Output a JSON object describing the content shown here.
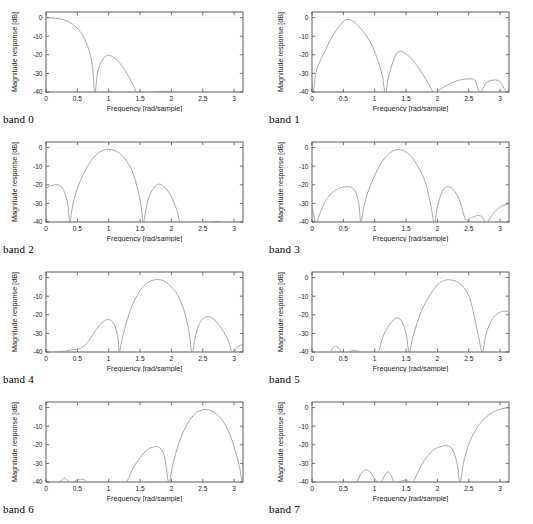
{
  "figure": {
    "title": "",
    "panel_count": 8,
    "grid": {
      "rows": 4,
      "cols": 2
    }
  },
  "axes": {
    "xlabel": "Frequency [rad/sample]",
    "ylabel": "Magnitude response [dB]",
    "xticks": [
      "0",
      "0.5",
      "1",
      "1.5",
      "2",
      "2.5",
      "3"
    ],
    "xtick_values": [
      0,
      0.5,
      1,
      1.5,
      2,
      2.5,
      3
    ],
    "yticks": [
      "0",
      "-10",
      "-20",
      "-30",
      "-40"
    ],
    "ytick_values": [
      0,
      -10,
      -20,
      -30,
      -40
    ],
    "xlim": [
      0,
      3.14159
    ],
    "ylim": [
      -40,
      3
    ],
    "grid": false,
    "box": true,
    "tick_direction": "in"
  },
  "colors": {
    "curve": "#8a8a8a",
    "axis": "#4d4d4d",
    "text": "#1a1a1a",
    "background": "#ffffff"
  },
  "captions": [
    "band 0",
    "band 1",
    "band 2",
    "band 3",
    "band 4",
    "band 5",
    "band 6",
    "band 7"
  ],
  "chart_data": [
    {
      "type": "line",
      "title": "band 0",
      "xlabel": "Frequency [rad/sample]",
      "ylabel": "Magnitude response [dB]",
      "xlim": [
        0,
        3.14159
      ],
      "ylim": [
        -40,
        3
      ],
      "grid": false,
      "legend": "none",
      "passband_center": 0.0,
      "nulls": [
        0.78,
        1.45
      ],
      "sidelobe_peaks": [
        {
          "x": 0.98,
          "y": -20
        },
        {
          "x": 1.9,
          "y": -39.5
        }
      ],
      "x": [
        0,
        0.1,
        0.2,
        0.3,
        0.4,
        0.5,
        0.6,
        0.68,
        0.74,
        0.78,
        0.82,
        0.88,
        0.98,
        1.1,
        1.2,
        1.3,
        1.4,
        1.45,
        1.55,
        1.7,
        1.9,
        2.1,
        2.4,
        2.7,
        3.0,
        3.14159
      ],
      "y": [
        -0.2,
        -0.3,
        -0.6,
        -1.4,
        -3.0,
        -5.8,
        -10.5,
        -17.0,
        -26.0,
        -41.0,
        -30.0,
        -24.0,
        -20.2,
        -22.0,
        -25.5,
        -30.5,
        -37.0,
        -40.5,
        -40.3,
        -40.2,
        -39.6,
        -40.2,
        -40.4,
        -40.3,
        -40.3,
        -40.3
      ]
    },
    {
      "type": "line",
      "title": "band 1",
      "xlabel": "Frequency [rad/sample]",
      "ylabel": "Magnitude response [dB]",
      "xlim": [
        0,
        3.14159
      ],
      "ylim": [
        -40,
        3
      ],
      "grid": false,
      "legend": "none",
      "passband_center": 0.56,
      "nulls": [
        0.02,
        1.17,
        1.95,
        2.68,
        3.1
      ],
      "sidelobe_peaks": [
        {
          "x": 1.38,
          "y": -18.2
        },
        {
          "x": 2.52,
          "y": -33.0
        },
        {
          "x": 2.9,
          "y": -33.5
        }
      ],
      "x": [
        0,
        0.02,
        0.06,
        0.12,
        0.2,
        0.3,
        0.4,
        0.5,
        0.56,
        0.64,
        0.74,
        0.85,
        0.95,
        1.05,
        1.12,
        1.17,
        1.22,
        1.3,
        1.38,
        1.5,
        1.62,
        1.75,
        1.88,
        1.95,
        2.05,
        2.2,
        2.35,
        2.45,
        2.52,
        2.6,
        2.68,
        2.78,
        2.9,
        3.0,
        3.1,
        3.14159
      ],
      "y": [
        -34.0,
        -40.5,
        -30.0,
        -24.0,
        -18.5,
        -11.5,
        -6.2,
        -2.2,
        -1.0,
        -1.6,
        -4.5,
        -9.0,
        -14.5,
        -23.0,
        -31.0,
        -41.0,
        -32.0,
        -23.0,
        -18.3,
        -19.6,
        -23.5,
        -29.5,
        -37.0,
        -40.5,
        -38.5,
        -35.5,
        -33.6,
        -33.1,
        -33.0,
        -33.8,
        -40.0,
        -35.0,
        -33.6,
        -34.5,
        -40.0,
        -38.0
      ]
    },
    {
      "type": "line",
      "title": "band 2",
      "xlabel": "Frequency [rad/sample]",
      "ylabel": "Magnitude response [dB]",
      "xlim": [
        0,
        3.14159
      ],
      "ylim": [
        -40,
        3
      ],
      "grid": false,
      "legend": "none",
      "passband_center": 1.0,
      "nulls": [
        0.38,
        1.55,
        2.15,
        2.62,
        2.85
      ],
      "sidelobe_peaks": [
        {
          "x": 0.18,
          "y": -20.0
        },
        {
          "x": 1.78,
          "y": -19.8
        },
        {
          "x": 2.72,
          "y": -39.6
        }
      ],
      "x": [
        0,
        0.06,
        0.12,
        0.18,
        0.25,
        0.31,
        0.35,
        0.38,
        0.42,
        0.48,
        0.58,
        0.7,
        0.82,
        0.92,
        1.0,
        1.1,
        1.2,
        1.3,
        1.38,
        1.46,
        1.52,
        1.55,
        1.6,
        1.66,
        1.78,
        1.9,
        2.0,
        2.08,
        2.15,
        2.3,
        2.5,
        2.62,
        2.72,
        2.85,
        3.0,
        3.14159
      ],
      "y": [
        -22.0,
        -20.8,
        -20.2,
        -20.0,
        -21.2,
        -25.5,
        -31.0,
        -41.0,
        -32.0,
        -24.0,
        -15.5,
        -8.0,
        -3.2,
        -1.4,
        -1.0,
        -1.6,
        -3.8,
        -8.0,
        -13.0,
        -22.0,
        -32.0,
        -41.0,
        -32.0,
        -25.0,
        -19.8,
        -21.5,
        -26.5,
        -33.0,
        -41.0,
        -40.3,
        -40.2,
        -40.4,
        -39.6,
        -40.4,
        -40.3,
        -40.3
      ]
    },
    {
      "type": "line",
      "title": "band 3",
      "xlabel": "Frequency [rad/sample]",
      "ylabel": "Magnitude response [dB]",
      "xlim": [
        0,
        3.14159
      ],
      "ylim": [
        -40,
        3
      ],
      "grid": false,
      "legend": "none",
      "passband_center": 1.35,
      "nulls": [
        0.07,
        0.78,
        1.95,
        2.45,
        2.78
      ],
      "sidelobe_peaks": [
        {
          "x": 0.58,
          "y": -21.0
        },
        {
          "x": 2.15,
          "y": -21.0
        },
        {
          "x": 2.65,
          "y": -36.5
        }
      ],
      "x": [
        0,
        0.04,
        0.07,
        0.12,
        0.2,
        0.3,
        0.42,
        0.52,
        0.58,
        0.64,
        0.7,
        0.75,
        0.78,
        0.82,
        0.88,
        0.98,
        1.1,
        1.22,
        1.35,
        1.48,
        1.6,
        1.72,
        1.82,
        1.9,
        1.95,
        2.0,
        2.07,
        2.15,
        2.25,
        2.35,
        2.45,
        2.55,
        2.65,
        2.72,
        2.78,
        2.9,
        3.02,
        3.14159
      ],
      "y": [
        -32.0,
        -38.0,
        -41.0,
        -36.0,
        -29.5,
        -25.0,
        -22.0,
        -21.2,
        -21.0,
        -21.6,
        -24.0,
        -31.0,
        -41.0,
        -33.0,
        -25.0,
        -16.5,
        -8.5,
        -3.5,
        -1.1,
        -2.0,
        -5.5,
        -12.0,
        -20.0,
        -32.0,
        -41.0,
        -32.0,
        -24.0,
        -21.0,
        -22.5,
        -28.0,
        -38.5,
        -37.5,
        -36.5,
        -37.5,
        -41.0,
        -35.0,
        -31.5,
        -30.5
      ]
    },
    {
      "type": "line",
      "title": "band 4",
      "xlabel": "Frequency [rad/sample]",
      "ylabel": "Magnitude response [dB]",
      "xlim": [
        0,
        3.14159
      ],
      "ylim": [
        -40,
        3
      ],
      "grid": false,
      "legend": "none",
      "passband_center": 1.78,
      "nulls": [
        0.04,
        1.17,
        2.33,
        2.98
      ],
      "sidelobe_peaks": [
        {
          "x": 0.98,
          "y": -22.5
        },
        {
          "x": 2.56,
          "y": -21.0
        },
        {
          "x": 0.5,
          "y": -38.5
        }
      ],
      "x": [
        0,
        0.04,
        0.12,
        0.3,
        0.42,
        0.5,
        0.58,
        0.68,
        0.78,
        0.88,
        0.98,
        1.05,
        1.1,
        1.15,
        1.17,
        1.2,
        1.26,
        1.35,
        1.48,
        1.6,
        1.7,
        1.78,
        1.88,
        2.0,
        2.1,
        2.2,
        2.28,
        2.33,
        2.38,
        2.45,
        2.56,
        2.68,
        2.8,
        2.9,
        2.98,
        3.06,
        3.14159
      ],
      "y": [
        -39.0,
        -41.0,
        -40.2,
        -39.5,
        -38.8,
        -38.5,
        -37.5,
        -34.0,
        -29.0,
        -24.5,
        -22.5,
        -23.5,
        -26.0,
        -33.0,
        -41.0,
        -35.0,
        -27.0,
        -17.0,
        -8.0,
        -3.2,
        -1.5,
        -1.1,
        -1.8,
        -5.0,
        -9.5,
        -17.5,
        -29.0,
        -41.0,
        -32.0,
        -24.5,
        -21.0,
        -22.5,
        -27.5,
        -33.5,
        -41.0,
        -37.0,
        -36.0
      ]
    },
    {
      "type": "line",
      "title": "band 5",
      "xlabel": "Frequency [rad/sample]",
      "ylabel": "Magnitude response [dB]",
      "xlim": [
        0,
        3.14159
      ],
      "ylim": [
        -40,
        3
      ],
      "grid": false,
      "legend": "none",
      "passband_center": 2.15,
      "nulls": [
        0.28,
        0.48,
        0.58,
        0.78,
        1.05,
        1.55,
        2.72
      ],
      "sidelobe_peaks": [
        {
          "x": 1.33,
          "y": -22.0
        },
        {
          "x": 0.38,
          "y": -37.0
        },
        {
          "x": 0.68,
          "y": -39.0
        },
        {
          "x": 3.05,
          "y": -18.0
        }
      ],
      "x": [
        0,
        0.1,
        0.2,
        0.28,
        0.33,
        0.38,
        0.44,
        0.48,
        0.56,
        0.62,
        0.68,
        0.74,
        0.8,
        0.92,
        1.05,
        1.12,
        1.2,
        1.33,
        1.42,
        1.5,
        1.55,
        1.6,
        1.68,
        1.8,
        1.95,
        2.05,
        2.15,
        2.28,
        2.4,
        2.52,
        2.62,
        2.7,
        2.72,
        2.78,
        2.88,
        3.0,
        3.08,
        3.14159
      ],
      "y": [
        -40.4,
        -40.4,
        -40.2,
        -40.5,
        -38.0,
        -37.0,
        -38.5,
        -40.5,
        -40.3,
        -39.5,
        -39.0,
        -39.8,
        -40.5,
        -40.3,
        -40.5,
        -33.0,
        -27.0,
        -22.0,
        -23.0,
        -30.0,
        -41.0,
        -33.0,
        -24.0,
        -14.0,
        -6.0,
        -2.6,
        -1.2,
        -1.8,
        -4.5,
        -11.5,
        -26.0,
        -39.0,
        -41.0,
        -30.0,
        -22.0,
        -18.6,
        -18.0,
        -18.5
      ]
    },
    {
      "type": "line",
      "title": "band 6",
      "xlabel": "Frequency [rad/sample]",
      "ylabel": "Magnitude response [dB]",
      "xlim": [
        0,
        3.14159
      ],
      "ylim": [
        -40,
        3
      ],
      "grid": false,
      "legend": "none",
      "passband_center": 2.55,
      "nulls": [
        0.2,
        0.38,
        0.48,
        0.68,
        1.27,
        1.96,
        3.13
      ],
      "sidelobe_peaks": [
        {
          "x": 1.78,
          "y": -21.0
        },
        {
          "x": 0.29,
          "y": -38.0
        },
        {
          "x": 0.58,
          "y": -38.5
        }
      ],
      "x": [
        0,
        0.1,
        0.2,
        0.25,
        0.29,
        0.34,
        0.38,
        0.45,
        0.52,
        0.58,
        0.63,
        0.68,
        0.8,
        1.0,
        1.15,
        1.27,
        1.38,
        1.5,
        1.62,
        1.72,
        1.78,
        1.85,
        1.9,
        1.96,
        2.02,
        2.12,
        2.25,
        2.38,
        2.48,
        2.55,
        2.65,
        2.78,
        2.9,
        3.0,
        3.08,
        3.13,
        3.14159
      ],
      "y": [
        -40.4,
        -40.4,
        -40.5,
        -39.0,
        -38.0,
        -39.0,
        -40.5,
        -39.8,
        -38.8,
        -38.5,
        -39.2,
        -40.5,
        -40.4,
        -40.4,
        -40.5,
        -41.0,
        -33.0,
        -27.0,
        -22.5,
        -21.2,
        -21.0,
        -23.0,
        -28.0,
        -41.0,
        -31.0,
        -19.0,
        -9.0,
        -3.2,
        -1.4,
        -1.1,
        -2.0,
        -5.5,
        -12.0,
        -21.0,
        -31.0,
        -41.0,
        -38.0
      ]
    },
    {
      "type": "line",
      "title": "band 7",
      "xlabel": "Frequency [rad/sample]",
      "ylabel": "Magnitude response [dB]",
      "xlim": [
        0,
        3.14159
      ],
      "ylim": [
        -40,
        3
      ],
      "grid": false,
      "legend": "none",
      "passband_center": 3.14159,
      "nulls": [
        0.7,
        1.0,
        1.1,
        1.32,
        1.6,
        2.36
      ],
      "sidelobe_peaks": [
        {
          "x": 0.86,
          "y": -33.5
        },
        {
          "x": 1.21,
          "y": -34.5
        },
        {
          "x": 2.15,
          "y": -20.5
        }
      ],
      "x": [
        0,
        0.15,
        0.3,
        0.45,
        0.6,
        0.7,
        0.78,
        0.86,
        0.94,
        1.0,
        1.05,
        1.1,
        1.15,
        1.21,
        1.27,
        1.32,
        1.42,
        1.52,
        1.6,
        1.7,
        1.82,
        1.95,
        2.05,
        2.15,
        2.25,
        2.32,
        2.36,
        2.42,
        2.52,
        2.65,
        2.78,
        2.9,
        3.0,
        3.08,
        3.14159
      ],
      "y": [
        -40.4,
        -40.4,
        -40.5,
        -40.4,
        -40.3,
        -41.0,
        -35.5,
        -33.5,
        -35.0,
        -38.5,
        -40.0,
        -41.0,
        -37.0,
        -34.5,
        -37.0,
        -41.0,
        -39.5,
        -39.0,
        -41.0,
        -34.0,
        -27.0,
        -22.5,
        -21.0,
        -20.5,
        -23.0,
        -31.0,
        -41.0,
        -29.0,
        -18.0,
        -10.0,
        -5.0,
        -2.2,
        -0.9,
        -0.3,
        -0.2
      ]
    }
  ]
}
